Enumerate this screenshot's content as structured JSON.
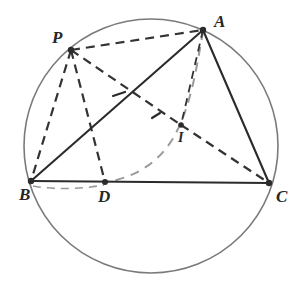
{
  "figure": {
    "canvas": {
      "width": 302,
      "height": 301,
      "background": "#ffffff"
    }
  },
  "colors": {
    "circle_stroke": "#7a7a7a",
    "solid_line": "#2b2b2b",
    "dark_dashed": "#333333",
    "light_dashed": "#9a9a9a",
    "vertex_dot": "#2b2b2b",
    "label_text": "#262626"
  },
  "circle": {
    "name": "circumcircle",
    "cx": 151,
    "cy": 146,
    "r": 127,
    "stroke_width": 1.6
  },
  "points": [
    {
      "id": "A",
      "label": "A",
      "x": 203,
      "y": 30,
      "label_x": 214,
      "label_y": 13,
      "dot_r": 3.2,
      "size": "main"
    },
    {
      "id": "P",
      "label": "P",
      "x": 71,
      "y": 50,
      "label_x": 52,
      "label_y": 29,
      "dot_r": 3.2,
      "size": "main"
    },
    {
      "id": "B",
      "label": "B",
      "x": 31,
      "y": 181,
      "label_x": 19,
      "label_y": 186,
      "dot_r": 3.2,
      "size": "main"
    },
    {
      "id": "C",
      "label": "C",
      "x": 269,
      "y": 183,
      "label_x": 276,
      "label_y": 188,
      "dot_r": 3.2,
      "size": "main"
    },
    {
      "id": "D",
      "label": "D",
      "x": 105,
      "y": 182,
      "label_x": 98,
      "label_y": 188,
      "dot_r": 3.0,
      "size": "main"
    },
    {
      "id": "I",
      "label": "I",
      "x": 181,
      "y": 125,
      "label_x": 178,
      "label_y": 131,
      "dot_r": 2.8,
      "size": "small"
    }
  ],
  "solid_segments": [
    {
      "name": "segment-A-B",
      "from": "A",
      "to": "B",
      "x1": 203,
      "y1": 30,
      "x2": 31,
      "y2": 181,
      "width": 2.1
    },
    {
      "name": "segment-A-C",
      "from": "A",
      "to": "C",
      "x1": 203,
      "y1": 30,
      "x2": 269,
      "y2": 183,
      "width": 2.1
    },
    {
      "name": "segment-B-C",
      "from": "B",
      "to": "C",
      "x1": 31,
      "y1": 181,
      "x2": 269,
      "y2": 183,
      "width": 2.1
    }
  ],
  "dark_dashed_segments": [
    {
      "name": "segment-P-A",
      "from": "P",
      "to": "A",
      "x1": 71,
      "y1": 50,
      "x2": 203,
      "y2": 30,
      "width": 2.2,
      "dash": "9 6"
    },
    {
      "name": "segment-P-B",
      "from": "P",
      "to": "B",
      "x1": 71,
      "y1": 50,
      "x2": 31,
      "y2": 181,
      "width": 2.2,
      "dash": "9 6"
    },
    {
      "name": "segment-P-D",
      "from": "P",
      "to": "D",
      "x1": 71,
      "y1": 50,
      "x2": 105,
      "y2": 182,
      "width": 2.2,
      "dash": "9 6"
    },
    {
      "name": "segment-P-I-D",
      "from": "P",
      "to": "D",
      "x1": 71,
      "y1": 50,
      "x2": 181,
      "y2": 125,
      "width": 2.2,
      "dash": "9 6"
    },
    {
      "name": "segment-I-C",
      "from": "I",
      "to": "C",
      "x1": 181,
      "y1": 125,
      "x2": 269,
      "y2": 183,
      "width": 2.2,
      "dash": "9 6"
    },
    {
      "name": "segment-A-I-extended",
      "from": "A",
      "to": "I",
      "x1": 203,
      "y1": 30,
      "x2": 181,
      "y2": 125,
      "width": 1.8,
      "dash": "8 6"
    }
  ],
  "light_dashed_paths": [
    {
      "name": "arc-A-to-D",
      "d": "M 203 31 C 196 72 190 110 172 140 C 155 167 130 178 107 182",
      "width": 2.0,
      "dash": "9 7"
    },
    {
      "name": "arc-B-to-D-lower",
      "d": "M 33 186 C 55 190 82 189 104 185",
      "width": 1.6,
      "dash": "8 6"
    }
  ],
  "tick_marks": [
    {
      "name": "tick-on-AB",
      "x1": 113,
      "y1": 96,
      "x2": 125,
      "y2": 92,
      "width": 2.2
    },
    {
      "name": "tick-on-PI",
      "x1": 152,
      "y1": 118,
      "x2": 160,
      "y2": 113,
      "width": 2.2
    }
  ],
  "annotations": {
    "figure_type": "euclidean-geometry-diagram",
    "shape_names": [
      "circle",
      "triangle",
      "cevian",
      "dashed-construction-lines"
    ]
  }
}
